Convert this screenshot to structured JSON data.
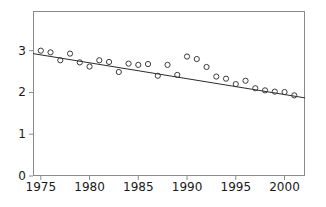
{
  "chart_data": {
    "type": "scatter",
    "title": "",
    "xlabel": "",
    "ylabel": "",
    "xlim": [
      1974.2,
      2002.1
    ],
    "ylim": [
      0,
      3.95
    ],
    "grid": false,
    "legend": null,
    "marker": "open-circle",
    "xticks": [
      1975,
      1980,
      1985,
      1990,
      1995,
      2000
    ],
    "yticks": [
      0,
      1,
      2,
      3
    ],
    "x": [
      1975,
      1976,
      1977,
      1978,
      1979,
      1980,
      1981,
      1982,
      1983,
      1984,
      1985,
      1986,
      1987,
      1988,
      1989,
      1990,
      1991,
      1992,
      1993,
      1994,
      1995,
      1996,
      1997,
      1998,
      1999,
      2000,
      2001
    ],
    "values": [
      3.0,
      2.96,
      2.77,
      2.93,
      2.72,
      2.62,
      2.77,
      2.73,
      2.49,
      2.69,
      2.66,
      2.68,
      2.4,
      2.66,
      2.42,
      2.86,
      2.8,
      2.61,
      2.38,
      2.33,
      2.2,
      2.28,
      2.1,
      2.05,
      2.02,
      2.01,
      1.93
    ],
    "series": [
      {
        "name": "observations",
        "type": "scatter",
        "values": [
          3.0,
          2.96,
          2.77,
          2.93,
          2.72,
          2.62,
          2.77,
          2.73,
          2.49,
          2.69,
          2.66,
          2.68,
          2.4,
          2.66,
          2.42,
          2.86,
          2.8,
          2.61,
          2.38,
          2.33,
          2.2,
          2.28,
          2.1,
          2.05,
          2.02,
          2.01,
          1.93
        ]
      },
      {
        "name": "trend-line",
        "type": "line",
        "x": [
          1974.2,
          2002.1
        ],
        "values": [
          2.93,
          1.87
        ]
      }
    ],
    "trend": {
      "x_start": 1974.2,
      "y_start": 2.93,
      "x_end": 2002.1,
      "y_end": 1.87
    }
  },
  "colors": {
    "axis": "#8a8a8a",
    "marker": "#3b3b3b",
    "line": "#2b2b2b",
    "text": "#1a1a1a",
    "background": "#ffffff"
  },
  "axis": {
    "ytick_labels": [
      "3",
      "2",
      "1",
      "0"
    ],
    "xtick_labels": [
      "1975",
      "1980",
      "1985",
      "1990",
      "1995",
      "2000"
    ]
  },
  "title_text": ""
}
